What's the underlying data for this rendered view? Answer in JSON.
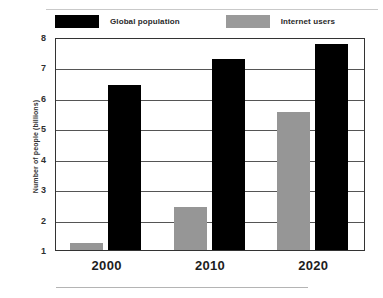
{
  "chart_data": {
    "type": "bar",
    "title": "",
    "xlabel": "",
    "ylabel": "Number of people (billions)",
    "categories": [
      "2000",
      "2010",
      "2020"
    ],
    "series": [
      {
        "name": "Global population",
        "color": "#000000",
        "values": [
          6.5,
          7.35,
          7.85
        ]
      },
      {
        "name": "Internet users",
        "color": "#969696",
        "values": [
          1.3,
          2.48,
          5.6
        ]
      }
    ],
    "series_order_in_group": [
      "Internet users",
      "Global population"
    ],
    "ylim": [
      1,
      8
    ],
    "yticks": [
      1,
      2,
      3,
      4,
      5,
      6,
      7,
      8
    ],
    "ytick_labels": [
      "1",
      "2",
      "3",
      "4",
      "5",
      "6",
      "7",
      "8"
    ],
    "grid": true,
    "grid_axis": "y",
    "legend_position": "top"
  },
  "legend": {
    "items": [
      {
        "label": "Global population",
        "swatch": "black-swatch"
      },
      {
        "label": "Internet users",
        "swatch": "gray-swatch"
      }
    ]
  },
  "axes": {
    "y_title": "Number of people (billions)",
    "y_tick_labels": [
      "8",
      "7",
      "6",
      "5",
      "4",
      "3",
      "2",
      "1"
    ],
    "x_tick_labels": [
      "2000",
      "2010",
      "2020"
    ]
  }
}
